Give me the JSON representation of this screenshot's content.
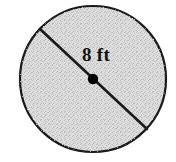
{
  "figure": {
    "kind": "geometry-diagram",
    "shape": "circle",
    "background_color": "#ffffff",
    "circle": {
      "center_x": 93,
      "center_y": 79,
      "radius": 74,
      "fill_color": "#d6d6d6",
      "fill_texture": "stipple",
      "stroke_color": "#1a1a1a",
      "stroke_width": 2
    },
    "diameter_segment": {
      "name": "diameter",
      "x1": 40,
      "y1": 29,
      "x2": 147,
      "y2": 129,
      "stroke_color": "#1a1a1a",
      "stroke_width": 2.6
    },
    "center_point": {
      "x": 93,
      "y": 79,
      "radius": 5,
      "color": "#000000"
    },
    "label": {
      "text": "8 ft",
      "value": "8",
      "unit": "ft",
      "x": 82,
      "y": 45,
      "color": "#111111",
      "font_size": 19
    }
  }
}
